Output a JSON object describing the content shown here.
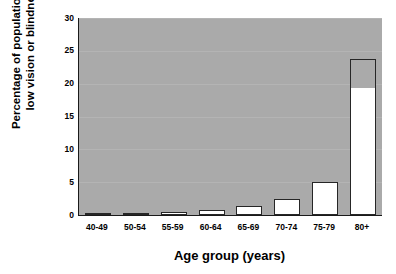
{
  "chart_data": {
    "type": "bar",
    "title": "",
    "subtitle": "",
    "xlabel": "Age group (years)",
    "ylabel_line1": "Percentage of population with",
    "ylabel_line2": "low vision or blindness",
    "categories": [
      "40-49",
      "50-54",
      "55-59",
      "60-64",
      "65-69",
      "70-74",
      "75-79",
      "80+"
    ],
    "values": [
      0.3,
      0.35,
      0.5,
      0.8,
      1.4,
      2.5,
      5.0,
      23.8
    ],
    "series": [
      {
        "name": "Percentage of population with low vision or blindness",
        "values": [
          0.3,
          0.35,
          0.5,
          0.8,
          1.4,
          2.5,
          5.0,
          23.8
        ]
      }
    ],
    "bar_fill_top": [
      0.3,
      0.35,
      0.5,
      0.8,
      1.4,
      2.5,
      5.0,
      19.5
    ],
    "ylim": [
      0,
      30
    ],
    "yticks": [
      0,
      5,
      10,
      15,
      20,
      25,
      30
    ],
    "ytick_labels": [
      "0",
      "5",
      "10",
      "15",
      "20",
      "25",
      "30"
    ],
    "grid": true,
    "grid_axis": "y",
    "legend": false,
    "legend_position": "none",
    "plot_background_color": "#aaaaaa",
    "figure_background_color": "#ffffff",
    "bar_fill_color": "#ffffff",
    "bar_edge_color": "#262626",
    "axis_color": "#1a1a1a",
    "gridline_color": "#b4b4b4",
    "text_color": "#000000"
  }
}
